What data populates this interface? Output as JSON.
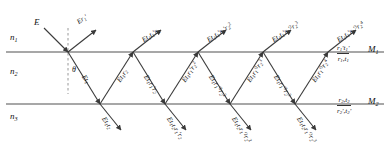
{
  "figure": {
    "type": "optics-ray-diagram",
    "media": [
      {
        "name": "n1",
        "label_html": "n<sub>1</sub>",
        "y": 38
      },
      {
        "name": "n2",
        "label_html": "n<sub>2</sub>",
        "y": 72
      },
      {
        "name": "n3",
        "label_html": "n<sub>3</sub>",
        "y": 118
      }
    ],
    "interfaces": [
      {
        "name": "M1",
        "label": "M1",
        "y": 52,
        "coeff_top": "r1't1'",
        "coeff_bottom": "r1,t1"
      },
      {
        "name": "M2",
        "label": "M2",
        "y": 104,
        "coeff_top": "r2,t2",
        "coeff_bottom": "r2',t2'"
      }
    ],
    "incident": {
      "label": "E",
      "x": 36,
      "y": 22
    },
    "angle": {
      "symbol": "θ",
      "x": 72,
      "y": 72
    },
    "normal": {
      "x": 68,
      "y_top": 30,
      "y_bottom": 92,
      "style": "dashed"
    },
    "top_vertices_x": [
      68,
      133,
      198,
      263,
      328
    ],
    "bottom_vertices_x": [
      100,
      165,
      230,
      295
    ],
    "reflected_rays": [
      {
        "name": "r0",
        "label_html": "Er<sub>1</sub>'",
        "x": 76,
        "y": 20,
        "rot": -34
      },
      {
        "name": "r1",
        "label_html": "Et<sub>1</sub>t<sub>1</sub>'r<sub>2</sub>",
        "x": 141,
        "y": 38,
        "rot": -34
      },
      {
        "name": "r2",
        "label_html": "Et<sub>1</sub>t<sub>1</sub>'r<sub>1</sub>'r<sub>2</sub><sup>2</sup>",
        "x": 206,
        "y": 38,
        "rot": -34
      },
      {
        "name": "r3",
        "label_html": "Et<sub>1</sub>t<sub>1</sub>'r<sub>1</sub>'<sup>2</sup>r<sub>2</sub><sup>3</sup>",
        "x": 271,
        "y": 38,
        "rot": -34
      },
      {
        "name": "r4",
        "label_html": "Et<sub>1</sub>t<sub>1</sub>'r<sub>1</sub>'<sup>3</sup>r<sub>2</sub><sup>4</sup>",
        "x": 336,
        "y": 38,
        "rot": -34
      }
    ],
    "internal_rays": [
      {
        "name": "d0",
        "label_html": "Et<sub>1</sub>",
        "x": 86,
        "y": 74,
        "rot": 57
      },
      {
        "name": "u1",
        "label_html": "Et<sub>1</sub>r<sub>2</sub>",
        "x": 116,
        "y": 80,
        "rot": -57
      },
      {
        "name": "d1",
        "label_html": "Et<sub>1</sub>r<sub>1</sub>'r<sub>2</sub>",
        "x": 148,
        "y": 74,
        "rot": 57
      },
      {
        "name": "u2",
        "label_html": "Et<sub>1</sub>r<sub>1</sub>'r<sub>2</sub><sup>2</sup>",
        "x": 181,
        "y": 80,
        "rot": -57
      },
      {
        "name": "d2",
        "label_html": "Et<sub>1</sub>r<sub>1</sub>'<sup>2</sup>r<sub>2</sub><sup>2</sup>",
        "x": 213,
        "y": 74,
        "rot": 57
      },
      {
        "name": "u3",
        "label_html": "Et<sub>1</sub>r<sub>1</sub>'<sup>2</sup>r<sub>2</sub><sup>3</sup>",
        "x": 246,
        "y": 80,
        "rot": -57
      },
      {
        "name": "d3",
        "label_html": "Et<sub>1</sub>r<sub>1</sub>'<sup>3</sup>r<sub>2</sub><sup>3</sup>",
        "x": 278,
        "y": 74,
        "rot": 57
      },
      {
        "name": "u4",
        "label_html": "Et<sub>1</sub>r<sub>1</sub>'<sup>3</sup>r<sub>2</sub><sup>4</sup>",
        "x": 311,
        "y": 80,
        "rot": -57
      }
    ],
    "transmitted_rays": [
      {
        "name": "t0",
        "label_html": "Et<sub>1</sub>t<sub>2</sub>",
        "x": 106,
        "y": 116,
        "rot": 57
      },
      {
        "name": "t1",
        "label_html": "Et<sub>1</sub>t<sub>2</sub>r<sub>1</sub>'r<sub>2</sub>",
        "x": 171,
        "y": 116,
        "rot": 57
      },
      {
        "name": "t2",
        "label_html": "Et<sub>1</sub>t<sub>2</sub>r<sub>1</sub>'<sup>2</sup>r<sub>2</sub><sup>2</sup>",
        "x": 236,
        "y": 116,
        "rot": 57
      },
      {
        "name": "t3",
        "label_html": "Et<sub>1</sub>t<sub>2</sub>r<sub>1</sub>'<sup>3</sup>r<sub>2</sub><sup>3</sup>",
        "x": 301,
        "y": 116,
        "rot": 57
      }
    ],
    "colors": {
      "interface_line": "#7a7a7a",
      "ray_line": "#4a4a4a",
      "text": "#111111",
      "background": "#ffffff"
    }
  }
}
